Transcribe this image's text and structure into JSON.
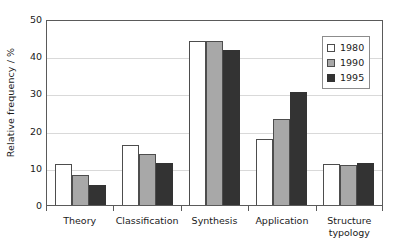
{
  "chart_data": {
    "type": "bar",
    "title": "",
    "xlabel": "",
    "ylabel": "Relative frequency / %",
    "ylim": [
      0,
      50
    ],
    "yticks": [
      0,
      10,
      20,
      30,
      40,
      50
    ],
    "ytick_labels": [
      "0",
      "10",
      "20",
      "30",
      "40",
      "50"
    ],
    "grid": "horizontal",
    "legend_position": "top-right",
    "categories": [
      "Theory",
      "Classification",
      "Synthesis",
      "Application",
      "Structure typology"
    ],
    "category_lines": [
      [
        "Theory"
      ],
      [
        "Classification"
      ],
      [
        "Synthesis"
      ],
      [
        "Application"
      ],
      [
        "Structure",
        "typology"
      ]
    ],
    "series": [
      {
        "name": "1980",
        "color": "#ffffff",
        "values": [
          11.0,
          16.1,
          44.0,
          17.7,
          11.1
        ]
      },
      {
        "name": "1990",
        "color": "#a8a8a8",
        "values": [
          8.0,
          13.7,
          44.2,
          23.1,
          10.8
        ]
      },
      {
        "name": "1995",
        "color": "#333333",
        "values": [
          5.3,
          11.3,
          41.7,
          30.3,
          11.3
        ]
      }
    ]
  },
  "legend": {
    "entries": [
      {
        "label": "1980"
      },
      {
        "label": "1990"
      },
      {
        "label": "1995"
      }
    ]
  },
  "colors": {
    "series_1980": "#ffffff",
    "series_1990": "#a8a8a8",
    "series_1995": "#333333",
    "axis": "#5a5a5a",
    "grid": "#d9d9d9",
    "background": "#ffffff",
    "text": "#1a1a1a"
  }
}
